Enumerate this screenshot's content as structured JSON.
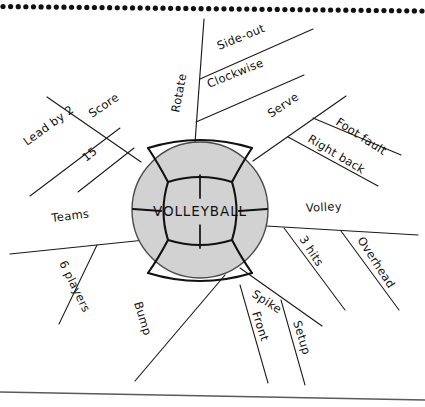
{
  "document": {
    "title": "VOLLEYBALL",
    "type": "hand-drawn mind map on notebook paper",
    "paper": {
      "background_color": "#ffffff",
      "binding_dots_count": 56,
      "binding_dot_color": "#111111",
      "bottom_edge_color": "#5a5a5a"
    }
  },
  "center": {
    "label": "VOLLEYBALL",
    "shape": "volleyball",
    "fill_color": "#d2d2d2",
    "seam_color": "#111111",
    "outline_color": "#4a4a4a",
    "cx": 200,
    "cy": 210,
    "r": 68
  },
  "chart_data": {
    "type": "mindmap",
    "title": "VOLLEYBALL",
    "root": "VOLLEYBALL",
    "branch_count": 7,
    "branches": [
      {
        "id": "score",
        "label": "Score",
        "angle_deg": 214,
        "children": [
          {
            "id": "lead-by-2",
            "label": "Lead by 2"
          },
          {
            "id": "fifteen",
            "label": "15"
          }
        ]
      },
      {
        "id": "rotate",
        "label": "Rotate",
        "angle_deg": 268,
        "children": [
          {
            "id": "side-out",
            "label": "Side-out"
          },
          {
            "id": "clockwise",
            "label": "Clockwise"
          }
        ]
      },
      {
        "id": "serve",
        "label": "Serve",
        "angle_deg": 318,
        "children": [
          {
            "id": "foot-fault",
            "label": "Foot fault"
          },
          {
            "id": "right-back",
            "label": "Right back"
          }
        ]
      },
      {
        "id": "volley",
        "label": "Volley",
        "angle_deg": 4,
        "children": [
          {
            "id": "three-hits",
            "label": "3 hits"
          },
          {
            "id": "overhead",
            "label": "Overhead"
          }
        ]
      },
      {
        "id": "spike",
        "label": "Spike",
        "angle_deg": 42,
        "children": [
          {
            "id": "front",
            "label": "Front"
          },
          {
            "id": "setup",
            "label": "Setup"
          }
        ]
      },
      {
        "id": "bump",
        "label": "Bump",
        "angle_deg": 78,
        "children": []
      },
      {
        "id": "teams",
        "label": "Teams",
        "angle_deg": 172,
        "children": [
          {
            "id": "six-players",
            "label": "6 players"
          }
        ]
      }
    ]
  },
  "labels": {
    "score": "Score",
    "lead_by_2": "Lead by 2",
    "fifteen": "15",
    "rotate": "Rotate",
    "side_out": "Side-out",
    "clockwise": "Clockwise",
    "serve": "Serve",
    "foot_fault": "Foot fault",
    "right_back": "Right back",
    "volley": "Volley",
    "three_hits": "3 hits",
    "overhead": "Overhead",
    "spike": "Spike",
    "front": "Front",
    "setup": "Setup",
    "bump": "Bump",
    "teams": "Teams",
    "six_players": "6 players",
    "center": "VOLLEYBALL"
  }
}
